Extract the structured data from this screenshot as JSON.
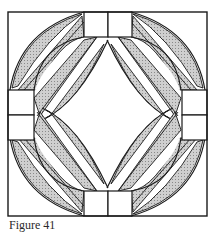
{
  "figure": {
    "caption": "Figure 41",
    "colors": {
      "line": "#1a1a1a",
      "shade": "#b8b8b8",
      "background": "#ffffff"
    }
  }
}
